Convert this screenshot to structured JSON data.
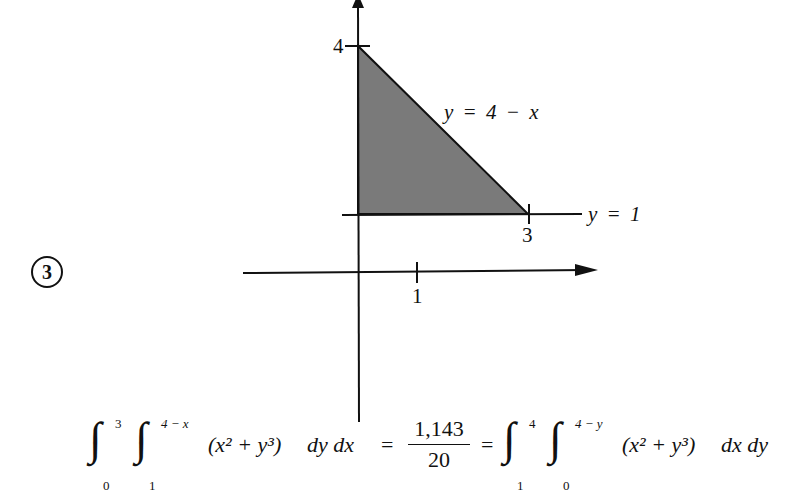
{
  "problem": {
    "number": "3"
  },
  "figure": {
    "axis_ticks": {
      "y_tick_label": "4",
      "x_tick_label_region": "3",
      "x_tick_label_axis": "1"
    },
    "curve_labels": {
      "hypotenuse": "y = 4 − x",
      "horizontal_line": "y = 1"
    },
    "region": {
      "vertices": [
        [
          0,
          1
        ],
        [
          0,
          4
        ],
        [
          3,
          1
        ]
      ],
      "fill_color": "#7a7a7a"
    }
  },
  "equation": {
    "lhs": {
      "outer_integral": {
        "lower": "0",
        "upper": "3"
      },
      "inner_integral": {
        "lower": "1",
        "upper": "4 − x"
      },
      "integrand": "(x² + y³)",
      "differentials": "dy dx"
    },
    "equals_1": "=",
    "value": {
      "numerator": "1,143",
      "denominator": "20"
    },
    "equals_2": "=",
    "rhs": {
      "outer_integral": {
        "lower": "1",
        "upper": "4"
      },
      "inner_integral": {
        "lower": "0",
        "upper": "4 − y"
      },
      "integrand": "(x² + y³)",
      "differentials": "dx dy"
    }
  }
}
